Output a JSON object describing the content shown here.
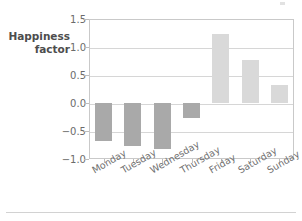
{
  "chart_data": {
    "type": "bar",
    "title": "",
    "xlabel": "",
    "ylabel": "Happiness factor",
    "ylabel_lines": [
      "Happiness",
      "factor"
    ],
    "categories": [
      "Monday",
      "Tuesday",
      "Wednesday",
      "Thursday",
      "Friday",
      "Saturday",
      "Sunday"
    ],
    "values": [
      -0.67,
      -0.76,
      -0.83,
      -0.27,
      1.24,
      0.77,
      0.33
    ],
    "ylim": [
      -1.0,
      1.5
    ],
    "yticks": [
      1.5,
      1.0,
      0.5,
      0.0,
      -0.5,
      -1.0
    ],
    "ytick_labels": [
      "1.5",
      "1.0",
      "0.5",
      "0.0",
      "−0.5",
      "−1.0"
    ],
    "grid": true,
    "legend": "none",
    "bar_color_positive": "#d9d9d9",
    "bar_color_negative": "#a9a9a9",
    "gridline_color": "#d6d6d6",
    "frame_color": "#c9c9c9",
    "xlabel_rotation_deg": -30
  }
}
